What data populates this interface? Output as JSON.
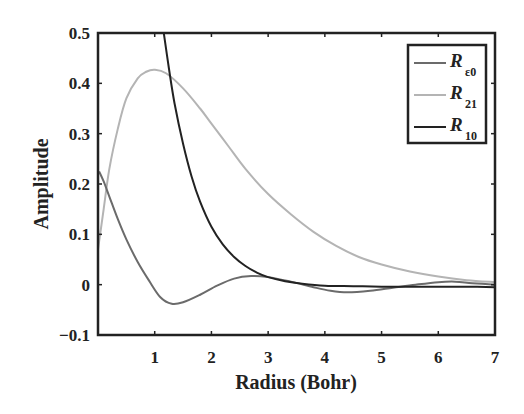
{
  "chart_data": {
    "type": "line",
    "title": "",
    "xlabel": "Radius (Bohr)",
    "ylabel": "Amplitude",
    "xlim": [
      0,
      7
    ],
    "ylim": [
      -0.1,
      0.5
    ],
    "xticks": [
      1,
      2,
      3,
      4,
      5,
      6,
      7
    ],
    "xtick_labels": [
      "1",
      "2",
      "3",
      "4",
      "5",
      "6",
      "7"
    ],
    "yticks": [
      -0.1,
      0,
      0.1,
      0.2,
      0.3,
      0.4,
      0.5
    ],
    "ytick_labels": [
      "−0.1",
      "0",
      "0.1",
      "0.2",
      "0.3",
      "0.4",
      "0.5"
    ],
    "grid": false,
    "legend_position": "upper right",
    "series": [
      {
        "name": "R_ε0",
        "label_main": "R",
        "label_sub": "ε0",
        "color": "#6b6b6b",
        "x": [
          0.02,
          0.1,
          0.2,
          0.35,
          0.5,
          0.7,
          0.9,
          1.1,
          1.3,
          1.5,
          1.8,
          2.1,
          2.4,
          2.7,
          3.0,
          3.4,
          3.8,
          4.1,
          4.4,
          4.8,
          5.2,
          5.6,
          6.0,
          6.3,
          6.6,
          7.0
        ],
        "y": [
          0.225,
          0.205,
          0.175,
          0.13,
          0.09,
          0.045,
          0.008,
          -0.025,
          -0.038,
          -0.035,
          -0.02,
          -0.002,
          0.012,
          0.017,
          0.015,
          0.006,
          -0.005,
          -0.012,
          -0.015,
          -0.012,
          -0.006,
          0.0,
          0.005,
          0.006,
          0.003,
          0.0
        ]
      },
      {
        "name": "R_21",
        "label_main": "R",
        "label_sub": "21",
        "color": "#b4b4b4",
        "x": [
          0.0,
          0.1,
          0.2,
          0.35,
          0.5,
          0.7,
          0.85,
          1.0,
          1.2,
          1.5,
          1.8,
          2.0,
          2.3,
          2.6,
          3.0,
          3.4,
          3.8,
          4.2,
          4.6,
          5.0,
          5.5,
          6.0,
          6.5,
          7.0
        ],
        "y": [
          0.07,
          0.15,
          0.23,
          0.31,
          0.37,
          0.41,
          0.423,
          0.427,
          0.42,
          0.39,
          0.35,
          0.32,
          0.275,
          0.23,
          0.18,
          0.14,
          0.105,
          0.077,
          0.055,
          0.04,
          0.026,
          0.016,
          0.009,
          0.005
        ]
      },
      {
        "name": "R_10",
        "label_main": "R",
        "label_sub": "10",
        "color": "#222222",
        "x": [
          1.16,
          1.25,
          1.35,
          1.5,
          1.65,
          1.8,
          2.0,
          2.2,
          2.4,
          2.6,
          2.8,
          3.0,
          3.3,
          3.6,
          4.0,
          4.5,
          5.0,
          5.5,
          6.0,
          6.5,
          7.0
        ],
        "y": [
          0.5,
          0.43,
          0.36,
          0.28,
          0.215,
          0.165,
          0.115,
          0.08,
          0.055,
          0.037,
          0.024,
          0.015,
          0.007,
          0.002,
          -0.002,
          -0.003,
          -0.004,
          -0.004,
          -0.004,
          -0.004,
          -0.005
        ]
      }
    ]
  },
  "layout": {
    "plot_left": 98,
    "plot_right": 495,
    "plot_top": 33,
    "plot_bottom": 335
  }
}
